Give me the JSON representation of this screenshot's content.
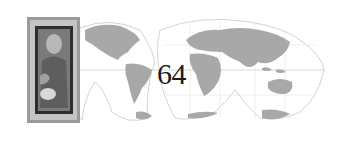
{
  "page": {
    "number": "64"
  },
  "graphic": {
    "map_icon": "world-map-interrupted-projection",
    "image_icon": "framed-icon-painting"
  },
  "colors": {
    "land": "#a8a8a8",
    "outline": "#bdbdbd",
    "text": "#1a1a1a",
    "frame": "#5a5a5a"
  }
}
